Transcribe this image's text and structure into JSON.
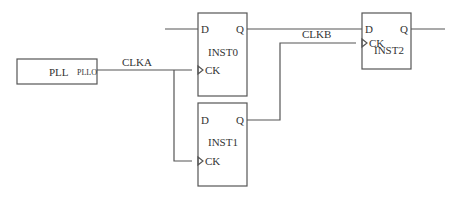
{
  "diagram": {
    "type": "flip-flop clock tree schematic",
    "blocks": {
      "pll": {
        "name": "PLL",
        "output_pin": "PLLO"
      },
      "inst0": {
        "name": "INST0",
        "pins": {
          "d": "D",
          "q": "Q",
          "ck": "CK"
        }
      },
      "inst1": {
        "name": "INST1",
        "pins": {
          "d": "D",
          "q": "Q",
          "ck": "CK"
        }
      },
      "inst2": {
        "name": "INST2",
        "pins": {
          "d": "D",
          "q": "Q",
          "ck": "CK"
        }
      }
    },
    "nets": {
      "clka": "CLKA",
      "clkb": "CLKB"
    },
    "connections": [
      {
        "from": "PLL.PLLO",
        "to": [
          "INST0.CK",
          "INST1.CK"
        ],
        "net": "CLKA"
      },
      {
        "from": "INST1.Q",
        "to": [
          "INST2.CK"
        ],
        "net": "CLKB"
      },
      {
        "from": "INST0.Q",
        "to": [
          "INST2.D"
        ]
      }
    ],
    "colors": {
      "line": "#555555",
      "text": "#333333",
      "background": "#ffffff"
    }
  }
}
